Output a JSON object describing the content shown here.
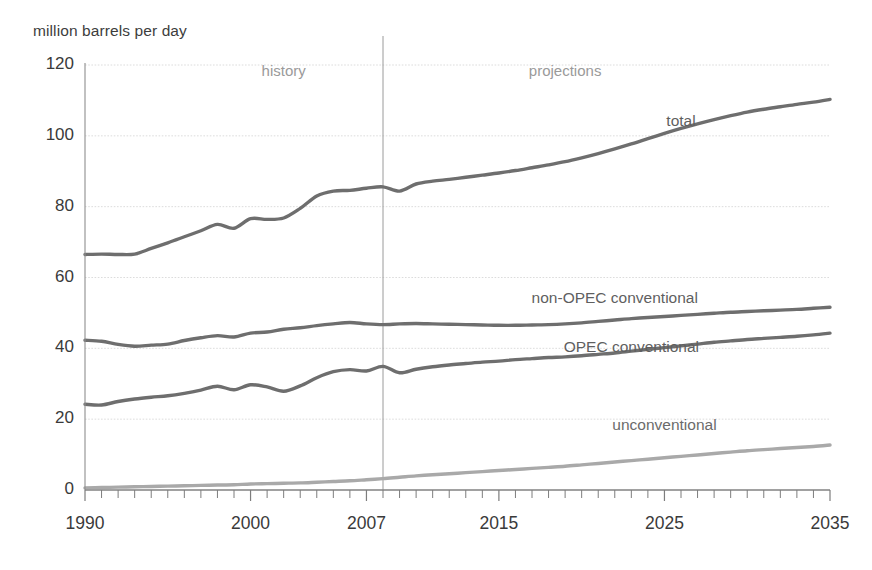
{
  "chart_data": {
    "type": "line",
    "title": "",
    "subtitle": "",
    "ylabel": "million barrels per day",
    "xlabel": "",
    "ylim": [
      0,
      120
    ],
    "yticks": [
      0,
      20,
      40,
      60,
      80,
      100,
      120
    ],
    "ytick_labels": [
      "0",
      "20",
      "40",
      "60",
      "80",
      "100",
      "120"
    ],
    "xlim": [
      1990,
      2035
    ],
    "xticks": [
      1990,
      2000,
      2007,
      2015,
      2025,
      2035
    ],
    "xtick_labels": [
      "1990",
      "2000",
      "2007",
      "2015",
      "2025",
      "2035"
    ],
    "x_minor_tick_interval": 1,
    "grid": "horizontal",
    "legend": "inline-labels",
    "annotations": [
      {
        "text": "history",
        "x": 2002,
        "y": 118,
        "color": "#9a9a9a"
      },
      {
        "text": "projections",
        "x": 2019,
        "y": 118,
        "color": "#9a9a9a"
      }
    ],
    "divider": {
      "x": 2008,
      "label": "history / projections boundary",
      "color": "#9a9a9a"
    },
    "x": [
      1990,
      1991,
      1992,
      1993,
      1994,
      1995,
      1996,
      1997,
      1998,
      1999,
      2000,
      2001,
      2002,
      2003,
      2004,
      2005,
      2006,
      2007,
      2008,
      2009,
      2010,
      2011,
      2012,
      2013,
      2014,
      2015,
      2016,
      2017,
      2018,
      2019,
      2020,
      2021,
      2022,
      2023,
      2024,
      2025,
      2026,
      2027,
      2028,
      2029,
      2030,
      2031,
      2032,
      2033,
      2034,
      2035
    ],
    "series": [
      {
        "name": "total",
        "color": "#6e6e6e",
        "label_x": 2026,
        "label_y": 104,
        "values": [
          66.5,
          66.6,
          66.5,
          66.6,
          68.2,
          69.8,
          71.5,
          73.2,
          75.0,
          73.9,
          76.6,
          76.4,
          76.8,
          79.5,
          83.0,
          84.4,
          84.6,
          85.2,
          85.6,
          84.4,
          86.4,
          87.2,
          87.7,
          88.3,
          88.9,
          89.5,
          90.2,
          91.0,
          91.8,
          92.7,
          93.8,
          95.0,
          96.3,
          97.7,
          99.2,
          100.7,
          102.1,
          103.4,
          104.6,
          105.7,
          106.7,
          107.5,
          108.2,
          108.9,
          109.5,
          110.3
        ]
      },
      {
        "name": "non-OPEC conventional",
        "color": "#6e6e6e",
        "label_x": 2022,
        "label_y": 54,
        "values": [
          42.3,
          42.0,
          41.1,
          40.6,
          40.9,
          41.2,
          42.2,
          43.0,
          43.6,
          43.2,
          44.3,
          44.6,
          45.4,
          45.8,
          46.4,
          46.9,
          47.3,
          46.9,
          46.7,
          46.9,
          47.0,
          46.9,
          46.8,
          46.7,
          46.6,
          46.5,
          46.5,
          46.6,
          46.7,
          46.9,
          47.2,
          47.6,
          48.0,
          48.4,
          48.7,
          49.0,
          49.3,
          49.6,
          49.9,
          50.2,
          50.4,
          50.6,
          50.8,
          51.0,
          51.3,
          51.6
        ]
      },
      {
        "name": "OPEC conventional",
        "color": "#6e6e6e",
        "label_x": 2023,
        "label_y": 40,
        "values": [
          24.2,
          24.0,
          25.0,
          25.7,
          26.2,
          26.6,
          27.3,
          28.2,
          29.3,
          28.3,
          29.7,
          29.1,
          27.9,
          29.4,
          31.7,
          33.4,
          34.0,
          33.6,
          34.9,
          33.1,
          34.1,
          34.8,
          35.3,
          35.7,
          36.1,
          36.4,
          36.8,
          37.1,
          37.4,
          37.6,
          37.9,
          38.3,
          38.7,
          39.2,
          39.7,
          40.2,
          40.7,
          41.2,
          41.7,
          42.1,
          42.5,
          42.8,
          43.1,
          43.4,
          43.8,
          44.3
        ]
      },
      {
        "name": "unconventional",
        "color": "#a9a9a9",
        "label_x": 2025,
        "label_y": 18,
        "values": [
          0.6,
          0.7,
          0.8,
          0.9,
          1.0,
          1.1,
          1.2,
          1.3,
          1.4,
          1.5,
          1.7,
          1.8,
          1.9,
          2.0,
          2.2,
          2.4,
          2.6,
          2.9,
          3.2,
          3.6,
          4.0,
          4.3,
          4.6,
          4.9,
          5.2,
          5.5,
          5.8,
          6.1,
          6.4,
          6.7,
          7.1,
          7.5,
          7.9,
          8.3,
          8.7,
          9.1,
          9.5,
          9.9,
          10.3,
          10.7,
          11.1,
          11.4,
          11.7,
          12.0,
          12.3,
          12.7
        ]
      }
    ]
  }
}
